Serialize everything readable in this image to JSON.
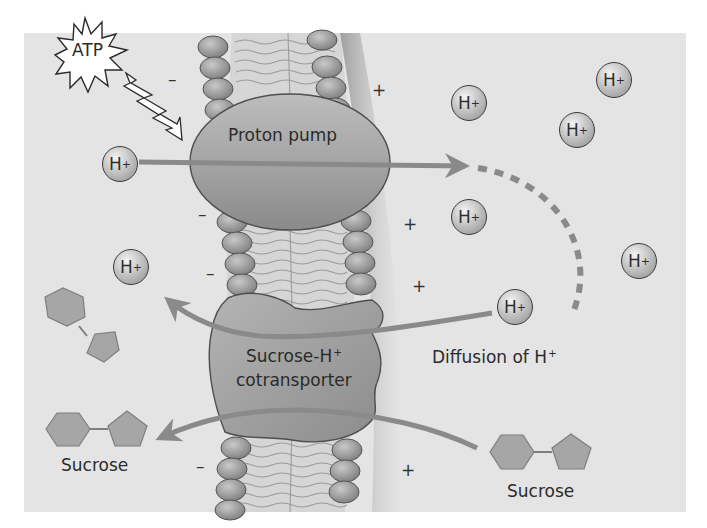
{
  "diagram": {
    "type": "membrane-transport",
    "colors": {
      "panel_background": "#e4e4e4",
      "page_background": "#ffffff",
      "protein_fill": "#9a9a9a",
      "arrow": "#8a8a8a",
      "sugar_fill": "#a6a6a6",
      "ion_outline": "#3a3a3a"
    }
  },
  "labels": {
    "atp": "ATP",
    "proton_pump": "Proton pump",
    "cotransporter_line1": "Sucrose-H",
    "cotransporter_sup": "+",
    "cotransporter_line2": "cotransporter",
    "diffusion": "Diffusion of H",
    "diffusion_sup": "+",
    "sucrose_left": "Sucrose",
    "sucrose_right": "Sucrose"
  },
  "ions": [
    {
      "label": "H",
      "charge": "+",
      "x": 102,
      "y": 146
    },
    {
      "label": "H",
      "charge": "+",
      "x": 451,
      "y": 85
    },
    {
      "label": "H",
      "charge": "+",
      "x": 596,
      "y": 62
    },
    {
      "label": "H",
      "charge": "+",
      "x": 559,
      "y": 112
    },
    {
      "label": "H",
      "charge": "+",
      "x": 451,
      "y": 199
    },
    {
      "label": "H",
      "charge": "+",
      "x": 621,
      "y": 243
    },
    {
      "label": "H",
      "charge": "+",
      "x": 113,
      "y": 249
    },
    {
      "label": "H",
      "charge": "+",
      "x": 497,
      "y": 289
    }
  ],
  "signs": {
    "negative": [
      {
        "symbol": "–",
        "x": 168,
        "y": 71
      },
      {
        "symbol": "–",
        "x": 198,
        "y": 206
      },
      {
        "symbol": "–",
        "x": 206,
        "y": 265
      },
      {
        "symbol": "–",
        "x": 196,
        "y": 458
      }
    ],
    "positive": [
      {
        "symbol": "+",
        "x": 372,
        "y": 82
      },
      {
        "symbol": "+",
        "x": 403,
        "y": 216
      },
      {
        "symbol": "+",
        "x": 412,
        "y": 278
      },
      {
        "symbol": "+",
        "x": 401,
        "y": 462
      }
    ]
  }
}
